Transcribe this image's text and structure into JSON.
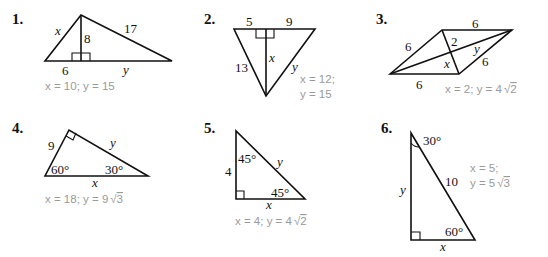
{
  "problems": [
    {
      "number": "1.",
      "figure": "triangle-with-altitude",
      "labels": {
        "side_left": "x",
        "altitude": "8",
        "side_right": "17",
        "base_left": "6",
        "base_right": "y"
      },
      "answer": "x = 10; y = 15"
    },
    {
      "number": "2.",
      "figure": "inverted-triangle-with-altitude",
      "labels": {
        "top_left": "5",
        "top_right": "9",
        "side_left": "13",
        "altitude": "x",
        "side_right": "y"
      },
      "answer_line1": "x = 12;",
      "answer_line2": "y = 15"
    },
    {
      "number": "3.",
      "figure": "rhombus-with-diagonals",
      "labels": {
        "upper_left": "6",
        "top": "6",
        "half_short_diag": "2",
        "half_long_diag": "y",
        "lower_right": "6",
        "x": "x",
        "bottom": "6"
      },
      "answer": "x = 2; y = 4",
      "answer_sqrt": "2"
    },
    {
      "number": "4.",
      "figure": "30-60-90-triangle",
      "labels": {
        "leg": "9",
        "hyp_leg": "y",
        "angle_left": "60°",
        "angle_right": "30°",
        "base": "x"
      },
      "answer": "x = 18; y = 9",
      "answer_sqrt": "3"
    },
    {
      "number": "5.",
      "figure": "45-45-90-triangle",
      "labels": {
        "angle_top": "45°",
        "hyp": "y",
        "leg": "4",
        "angle_right": "45°",
        "base": "x"
      },
      "answer": "x = 4; y = 4",
      "answer_sqrt": "2"
    },
    {
      "number": "6.",
      "figure": "30-60-90-triangle-tall",
      "labels": {
        "angle_top": "30°",
        "hyp": "10",
        "leg": "y",
        "angle_right": "60°",
        "base": "x"
      },
      "answer_line1": "x = 5;",
      "answer_line2": "y = 5",
      "answer_sqrt": "3"
    }
  ]
}
